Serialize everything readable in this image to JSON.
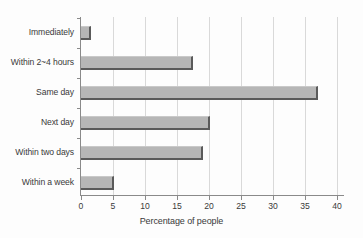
{
  "chart_data": {
    "type": "bar",
    "orientation": "horizontal",
    "title": "",
    "xlabel": "Percentage of people",
    "ylabel": "",
    "categories": [
      "Immediately",
      "Within 2~4 hours",
      "Same day",
      "Next day",
      "Within two days",
      "Within a week"
    ],
    "values": [
      1.5,
      17.5,
      37.0,
      20.1,
      19.1,
      5.2
    ],
    "xlim": [
      0,
      41
    ],
    "xticks": [
      0,
      5,
      10,
      15,
      20,
      25,
      30,
      35,
      40
    ],
    "xtick_labels": [
      "0",
      "5",
      "10",
      "15",
      "20",
      "25",
      "30",
      "35",
      "40"
    ],
    "grid": "vertical",
    "legend": "none",
    "colors": {
      "bar_fill": "#b6b6b6",
      "bar_edge": "#5a5a5a",
      "gridline": "#d9d9d9",
      "axis": "#8a8a8a",
      "text": "#3a3a3a",
      "background": "#fdfdfd"
    }
  }
}
